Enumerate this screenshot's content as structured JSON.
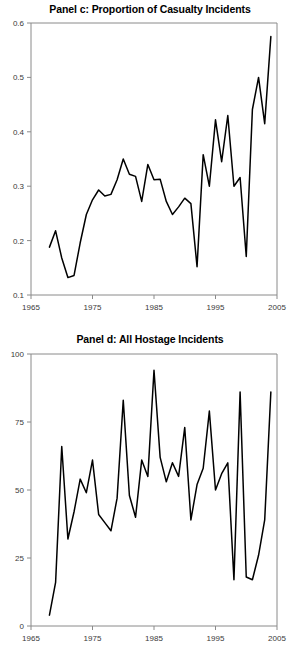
{
  "figure": {
    "background": "#ffffff",
    "line_color": "#000000",
    "axis_color": "#8a8a8a",
    "tick_label_color": "#3a3a3a"
  },
  "panels": [
    {
      "id": "panel-c",
      "title": "Panel c: Proportion of Casualty Incidents"
    },
    {
      "id": "panel-d",
      "title": "Panel d: All Hostage Incidents"
    }
  ],
  "chart_data": [
    {
      "type": "line",
      "title": "Panel c: Proportion of Casualty Incidents",
      "xlabel": "",
      "ylabel": "",
      "xlim": [
        1965,
        2005
      ],
      "ylim": [
        0.1,
        0.6
      ],
      "xticks": [
        1965,
        1975,
        1985,
        1995,
        2005
      ],
      "xtick_labels": [
        "1965",
        "1975",
        "1985",
        "1995",
        "2005"
      ],
      "yticks": [
        0.1,
        0.2,
        0.3,
        0.4,
        0.5,
        0.6
      ],
      "ytick_labels": [
        "0.1",
        "0.2",
        "0.3",
        "0.4",
        "0.5",
        "0.6"
      ],
      "grid": false,
      "legend": null,
      "x": [
        1968,
        1969,
        1970,
        1971,
        1972,
        1973,
        1974,
        1975,
        1976,
        1977,
        1978,
        1979,
        1980,
        1981,
        1982,
        1983,
        1984,
        1985,
        1986,
        1987,
        1988,
        1989,
        1990,
        1991,
        1992,
        1993,
        1994,
        1995,
        1996,
        1997,
        1998,
        1999,
        2000,
        2001,
        2002,
        2003,
        2004
      ],
      "values": [
        0.188,
        0.218,
        0.168,
        0.132,
        0.136,
        0.196,
        0.248,
        0.275,
        0.293,
        0.282,
        0.285,
        0.312,
        0.35,
        0.322,
        0.318,
        0.272,
        0.34,
        0.312,
        0.313,
        0.272,
        0.248,
        0.262,
        0.278,
        0.268,
        0.152,
        0.358,
        0.3,
        0.422,
        0.345,
        0.43,
        0.3,
        0.316,
        0.171,
        0.441,
        0.5,
        0.415,
        0.575
      ]
    },
    {
      "type": "line",
      "title": "Panel d: All Hostage Incidents",
      "xlabel": "",
      "ylabel": "",
      "xlim": [
        1965,
        2005
      ],
      "ylim": [
        0,
        100
      ],
      "xticks": [
        1965,
        1975,
        1985,
        1995,
        2005
      ],
      "xtick_labels": [
        "1965",
        "1975",
        "1985",
        "1995",
        "2005"
      ],
      "yticks": [
        0,
        25,
        50,
        75,
        100
      ],
      "ytick_labels": [
        "0",
        "25",
        "50",
        "75",
        "100"
      ],
      "grid": false,
      "legend": null,
      "x": [
        1968,
        1969,
        1970,
        1971,
        1972,
        1973,
        1974,
        1975,
        1976,
        1977,
        1978,
        1979,
        1980,
        1981,
        1982,
        1983,
        1984,
        1985,
        1986,
        1987,
        1988,
        1989,
        1990,
        1991,
        1992,
        1993,
        1994,
        1995,
        1996,
        1997,
        1998,
        1999,
        2000,
        2001,
        2002,
        2003,
        2004
      ],
      "values": [
        4,
        16,
        66,
        32,
        42,
        54,
        49,
        61,
        41,
        38,
        35,
        47,
        83,
        48,
        40,
        61,
        55,
        94,
        62,
        53,
        60,
        55,
        73,
        39,
        52,
        58,
        79,
        50,
        56,
        60,
        17,
        86,
        18,
        17,
        26,
        39,
        86
      ]
    }
  ]
}
